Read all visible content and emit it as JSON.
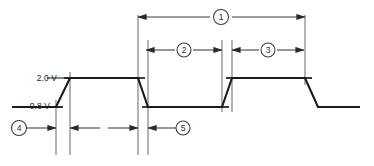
{
  "diagram": {
    "type": "timing-waveform",
    "canvas": {
      "width": 374,
      "height": 166
    },
    "colors": {
      "waveform": "#1b1b1b",
      "construction": "#6f6f6f",
      "dimension": "#3a3a3a",
      "background": "#ffffff",
      "callout_fill": "#ffffff"
    },
    "voltage_labels": [
      {
        "id": "v-high",
        "text": "2.0 V",
        "level": "high",
        "y": 78
      },
      {
        "id": "v-low",
        "text": "0.8 V",
        "level": "low",
        "y": 107
      }
    ],
    "callouts": [
      {
        "id": "callout-1",
        "label": "1",
        "cx": 221,
        "cy": 17,
        "r": 7.5,
        "measure": "full-period",
        "span_start": 138,
        "span_end": 305
      },
      {
        "id": "callout-2",
        "label": "2",
        "cx": 184,
        "cy": 50,
        "r": 7.0,
        "measure": "low-pulse-width",
        "span_start": 146,
        "span_end": 222
      },
      {
        "id": "callout-3",
        "label": "3",
        "cx": 268,
        "cy": 50,
        "r": 7.0,
        "measure": "high-pulse-width",
        "span_start": 232,
        "span_end": 304
      },
      {
        "id": "callout-4",
        "label": "4",
        "cx": 19,
        "cy": 128,
        "r": 7.5,
        "measure": "rise-start-offset",
        "span_start": 27,
        "span_end": 56
      },
      {
        "id": "callout-5",
        "label": "5",
        "cx": 183,
        "cy": 128,
        "r": 7.0,
        "measure": "fall-time",
        "span_start": 148,
        "span_end": 176
      }
    ],
    "waveform": {
      "high_y": 78,
      "low_y": 107,
      "points": "12,107 56,107 70,78 138,78 148,107 222,107 232,78 305,78 318,107 360,107",
      "transitions": [
        {
          "edge": "rise",
          "from_x": 56,
          "to_x": 70
        },
        {
          "edge": "fall",
          "from_x": 138,
          "to_x": 148
        },
        {
          "edge": "rise",
          "from_x": 222,
          "to_x": 232
        },
        {
          "edge": "fall",
          "from_x": 305,
          "to_x": 318
        }
      ]
    },
    "reference_lines": [
      {
        "id": "ref-high",
        "x1": 47,
        "x2": 78,
        "y": 78
      },
      {
        "id": "ref-low",
        "x1": 12,
        "x2": 62,
        "y": 107
      }
    ],
    "construction_lines": [
      {
        "id": "cl-a",
        "x": 56,
        "y1": 100,
        "y2": 155
      },
      {
        "id": "cl-b",
        "x": 70,
        "y1": 72,
        "y2": 155
      },
      {
        "id": "cl-c",
        "x": 138,
        "y1": 15,
        "y2": 155
      },
      {
        "id": "cl-d",
        "x": 148,
        "y1": 40,
        "y2": 155
      },
      {
        "id": "cl-e",
        "x": 222,
        "y1": 40,
        "y2": 112
      },
      {
        "id": "cl-f",
        "x": 232,
        "y1": 40,
        "y2": 112
      },
      {
        "id": "cl-g",
        "x": 305,
        "y1": 15,
        "y2": 85
      }
    ],
    "dimension_rows": [
      {
        "id": "dim-row-1",
        "y": 17
      },
      {
        "id": "dim-row-2",
        "y": 50
      },
      {
        "id": "dim-row-3",
        "y": 128
      }
    ]
  }
}
